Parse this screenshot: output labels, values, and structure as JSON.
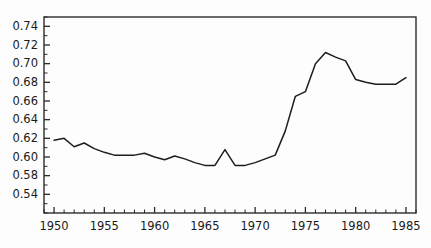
{
  "chart_data": {
    "type": "line",
    "title": "",
    "subtitle": "",
    "xlabel": "",
    "ylabel": "",
    "xlim": [
      1949,
      1986
    ],
    "ylim": [
      0.54,
      0.75
    ],
    "grid": false,
    "legend": null,
    "x_tick_labels": [
      "1950",
      "1955",
      "1960",
      "1965",
      "1970",
      "1975",
      "1980",
      "1985"
    ],
    "x_ticks": [
      1950,
      1955,
      1960,
      1965,
      1970,
      1975,
      1980,
      1985
    ],
    "x_minor_tick_step": 1,
    "y_tick_labels": [
      "0.74",
      "0.72",
      "0.70",
      "0.68",
      "0.66",
      "0.64",
      "0.62",
      "0.60",
      "0.58",
      "0.54"
    ],
    "y_ticks": [
      0.74,
      0.72,
      0.7,
      0.68,
      0.66,
      0.64,
      0.62,
      0.6,
      0.58,
      0.56
    ],
    "y_minor_tick_step": 0.01,
    "series": [
      {
        "name": "series-1",
        "color": "#1d1d1d",
        "x": [
          1950,
          1951,
          1952,
          1953,
          1954,
          1955,
          1956,
          1957,
          1958,
          1959,
          1960,
          1961,
          1962,
          1963,
          1964,
          1965,
          1966,
          1967,
          1968,
          1969,
          1970,
          1971,
          1972,
          1973,
          1974,
          1975,
          1976,
          1977,
          1978,
          1979,
          1980,
          1981,
          1982,
          1983,
          1984,
          1985
        ],
        "values": [
          0.618,
          0.62,
          0.611,
          0.615,
          0.609,
          0.605,
          0.602,
          0.602,
          0.602,
          0.604,
          0.6,
          0.597,
          0.601,
          0.598,
          0.594,
          0.591,
          0.591,
          0.608,
          0.591,
          0.591,
          0.594,
          0.598,
          0.602,
          0.628,
          0.665,
          0.67,
          0.7,
          0.712,
          0.707,
          0.703,
          0.683,
          0.68,
          0.678,
          0.678,
          0.678,
          0.685
        ]
      }
    ]
  }
}
